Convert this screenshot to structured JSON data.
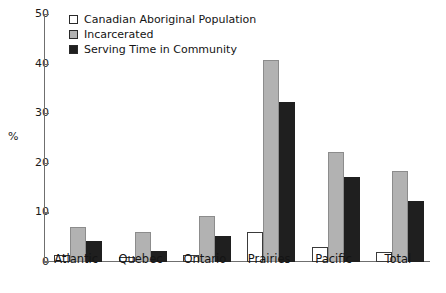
{
  "chart_data": {
    "type": "bar",
    "title": "",
    "xlabel": "",
    "ylabel": "%",
    "ylim": [
      0,
      50
    ],
    "yticks": [
      0,
      10,
      20,
      30,
      40,
      50
    ],
    "grid": false,
    "legend_position": "top-left",
    "categories": [
      "Atlantic",
      "Quebec",
      "Ontario",
      "Prairies",
      "Pacific",
      "Total"
    ],
    "series": [
      {
        "name": "Canadian Aboriginal Population",
        "color": "#ffffff",
        "values": [
          1.5,
          1.0,
          1.5,
          6.0,
          3.0,
          2.0
        ]
      },
      {
        "name": "Incarcerated",
        "color": "#b2b2b2",
        "values": [
          7.0,
          6.0,
          9.3,
          40.8,
          22.2,
          18.3
        ]
      },
      {
        "name": "Serving Time in Community",
        "color": "#1f1f1f",
        "values": [
          4.2,
          2.3,
          5.2,
          32.3,
          17.2,
          12.3
        ]
      }
    ]
  },
  "axis": {
    "y_label": "%",
    "y_tick_labels": [
      "0",
      "10",
      "20",
      "30",
      "40",
      "50"
    ]
  }
}
